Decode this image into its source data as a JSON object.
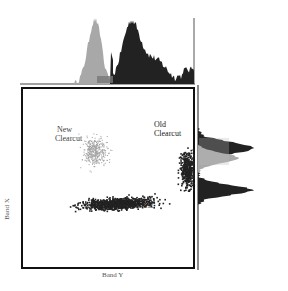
{
  "chart_data": {
    "type": "scatter",
    "title": "",
    "xlabel": "Band Y",
    "ylabel": "Band X",
    "grid": false,
    "legend": "none",
    "annotations": [
      {
        "text": "New\nClearcut",
        "line1": "New",
        "line2": "Clearcut",
        "color": "#999999"
      },
      {
        "text": "Old\nClearcut",
        "line1": "Old",
        "line2": "Clearcut",
        "color": "#222222"
      },
      {
        "text": "Natural Forest",
        "color": "#222222"
      }
    ],
    "clusters": [
      {
        "name": "New Clearcut",
        "color": "#a0a0a0",
        "center": [
          0.42,
          0.35
        ],
        "spread": [
          0.07,
          0.08
        ]
      },
      {
        "name": "Natural Forest",
        "color": "#222222",
        "center": [
          0.55,
          0.64
        ],
        "spread": [
          0.2,
          0.03
        ]
      },
      {
        "name": "Old Clearcut",
        "color": "#222222",
        "center": [
          0.96,
          0.45
        ],
        "spread": [
          0.04,
          0.1
        ]
      }
    ],
    "marginal_top": {
      "axis": "Band Y",
      "series": [
        {
          "name": "New Clearcut",
          "color": "#a8a8a8",
          "peak_x": 0.32,
          "height": 1.0
        },
        {
          "name": "Forest / Old Clearcut",
          "color": "#222222",
          "peak_x": 0.52,
          "height": 0.97
        }
      ]
    },
    "marginal_right": {
      "axis": "Band X",
      "series": [
        {
          "name": "Old Clearcut",
          "color": "#222222",
          "peak_y": 0.36,
          "length": 0.85
        },
        {
          "name": "New Clearcut",
          "color": "#a8a8a8",
          "peak_y": 0.46,
          "length": 0.66
        },
        {
          "name": "Natural Forest",
          "color": "#222222",
          "peak_y": 0.65,
          "length": 0.85
        }
      ]
    }
  }
}
